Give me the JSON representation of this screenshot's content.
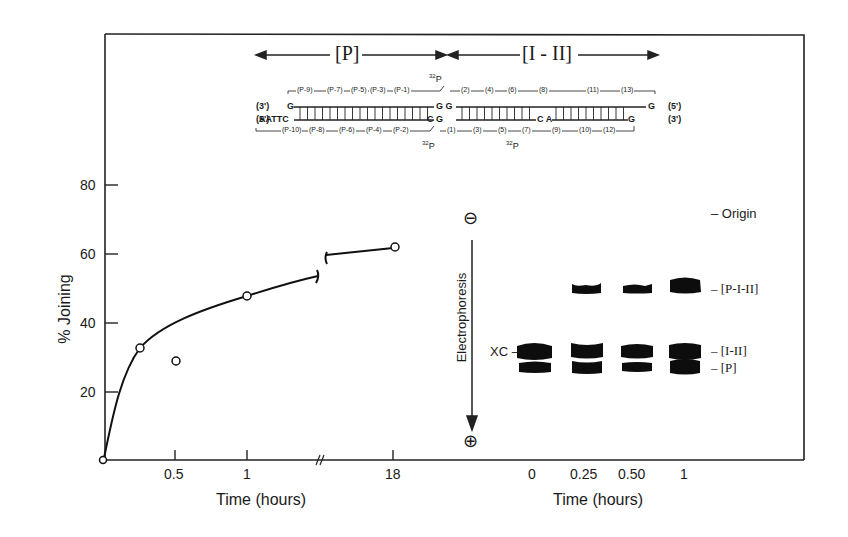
{
  "figure": {
    "panel_a": {
      "region_labels": {
        "left": "[P]",
        "right": "[I - II]"
      },
      "labels": {
        "three_prime_left": "(3')",
        "five_prime_left": "(5')",
        "five_prime_right": "(5')",
        "three_prime_right": "(3')",
        "top_left_base": "G",
        "bottom_left_bases": "AATTC",
        "junction_top": "G G",
        "junction_bottom": "C G",
        "mid_bottom": "C A",
        "top_right_base": "G",
        "bottom_right_base": "G",
        "p32_top": "32P",
        "p32_bottom_left": "32P",
        "p32_bottom_mid": "32P"
      },
      "top_strand_segments": [
        "(P-9)",
        "(P-7)",
        "(P-5)",
        "(P-3)",
        "(P-1)",
        "(2)",
        "(4)",
        "(6)",
        "(8)",
        "(11)",
        "(13)"
      ],
      "bottom_strand_segments": [
        "(P-10)",
        "(P-8)",
        "(P-6)",
        "(P-4)",
        "(P-2)",
        "(1)",
        "(3)",
        "(5)",
        "(7)",
        "(9)",
        "(10)",
        "(12)"
      ]
    },
    "gel": {
      "charge_top": "⊖",
      "charge_bottom": "⊕",
      "direction_label": "Electrophoresis",
      "marker_label": "XC",
      "band_labels": [
        "Origin",
        "[P-I-II]",
        "[I-II]",
        "[P]"
      ],
      "lane_labels": [
        "0",
        "0.25",
        "0.50",
        "1"
      ],
      "xlabel": "Time (hours)"
    }
  },
  "chart_data": [
    {
      "type": "line",
      "title": "",
      "xlabel": "Time (hours)",
      "ylabel": "% Joining",
      "x_ticks": [
        "0.5",
        "1",
        "18"
      ],
      "y_ticks": [
        "20",
        "40",
        "60",
        "80"
      ],
      "ylim": [
        0,
        85
      ],
      "axis_break": "between 1 and 18 hours",
      "grid": false,
      "legend": null,
      "series": [
        {
          "name": "% Joining",
          "marker": "open-circle",
          "x": [
            0,
            0.25,
            0.5,
            1,
            18
          ],
          "y": [
            0,
            32.5,
            37,
            47.5,
            62
          ]
        }
      ]
    },
    {
      "type": "table",
      "title": "Gel electrophoresis time course",
      "xlabel": "Time (hours)",
      "categories": [
        "0",
        "0.25",
        "0.50",
        "1"
      ],
      "bands": [
        {
          "name": "[P-I-II]",
          "present": [
            false,
            true,
            true,
            true
          ],
          "relative_intensity": [
            0,
            0.5,
            0.4,
            1.0
          ]
        },
        {
          "name": "[I-II]",
          "present": [
            true,
            true,
            true,
            true
          ],
          "relative_intensity": [
            1.0,
            1.0,
            0.9,
            1.0
          ]
        },
        {
          "name": "[P]",
          "present": [
            true,
            true,
            true,
            true
          ],
          "relative_intensity": [
            0.8,
            0.9,
            0.8,
            1.0
          ]
        }
      ],
      "markers": [
        "Origin",
        "XC"
      ]
    }
  ]
}
